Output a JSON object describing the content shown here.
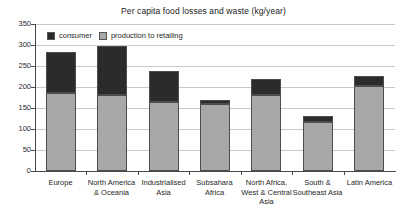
{
  "chart_data": {
    "type": "bar",
    "subtype": "stacked-bar",
    "title": "Per capita food losses and waste (kg/year)",
    "xlabel": "",
    "ylabel": "",
    "ylim": [
      0,
      350
    ],
    "ytick_step": 50,
    "yticks": [
      350,
      300,
      250,
      200,
      150,
      100,
      50,
      0
    ],
    "grid": true,
    "grid_axis": "y",
    "legend_position": "top-left-inside",
    "categories": [
      "Europe",
      "North America & Oceania",
      "Industrialised Asia",
      "Subsahara Africa",
      "North Africa, West & Central Asia",
      "South & Southeast Asia",
      "Latin America"
    ],
    "series": [
      {
        "name": "production to retailing",
        "color": "#a8a8a8",
        "values": [
          185,
          180,
          165,
          160,
          182,
          117,
          202
        ]
      },
      {
        "name": "consumer",
        "color": "#2b2b2b",
        "values": [
          98,
          118,
          73,
          8,
          37,
          13,
          24
        ]
      }
    ],
    "totals": [
      283,
      298,
      238,
      168,
      219,
      130,
      226
    ]
  },
  "chart": {
    "title": "Per capita food losses and waste (kg/year)"
  },
  "legend": {
    "items": [
      {
        "label": "consumer"
      },
      {
        "label": "production to retailing"
      }
    ]
  },
  "axes": {
    "y": {
      "ticks": [
        {
          "label": "350",
          "value": 350
        },
        {
          "label": "300",
          "value": 300
        },
        {
          "label": "250",
          "value": 250
        },
        {
          "label": "200",
          "value": 200
        },
        {
          "label": "150",
          "value": 150
        },
        {
          "label": "100",
          "value": 100
        },
        {
          "label": "50",
          "value": 50
        },
        {
          "label": "0",
          "value": 0
        }
      ]
    },
    "x": {
      "categories": [
        {
          "label": "Europe"
        },
        {
          "label": "North America & Oceania"
        },
        {
          "label": "Industrialised Asia"
        },
        {
          "label": "Subsahara Africa"
        },
        {
          "label": "North Africa, West & Central Asia"
        },
        {
          "label": "South & Southeast Asia"
        },
        {
          "label": "Latin America"
        }
      ]
    }
  },
  "colors": {
    "consumer": "#2b2b2b",
    "production": "#a8a8a8",
    "grid": "#c9c9c9",
    "axis": "#4a4a4a",
    "background": "#ffffff"
  }
}
